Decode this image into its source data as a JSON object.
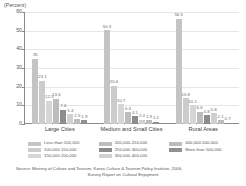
{
  "chart_data": {
    "type": "bar",
    "title": "",
    "ylabel": "(Percent)",
    "xlabel": "",
    "ylim": [
      0,
      60
    ],
    "yticks": [
      0,
      10,
      20,
      30,
      40,
      50,
      60
    ],
    "grid": true,
    "legend_position": "bottom",
    "categories": [
      "Large Cities",
      "Medium and Small Cities",
      "Rural Areas"
    ],
    "series": [
      {
        "name": "Less than 100,000",
        "color": "#c4c4c4",
        "values": [
          35.0,
          50.3,
          56.5
        ]
      },
      {
        "name": "100,000-150,000",
        "color": "#cccccc",
        "values": [
          23.1,
          20.6,
          13.8
        ]
      },
      {
        "name": "150,000-200,000",
        "color": "#d6d6d6",
        "values": [
          12.5,
          10.7,
          10.1
        ]
      },
      {
        "name": "200,000-250,000",
        "color": "#bdbdbd",
        "values": [
          13.6,
          6.3,
          6.6
        ]
      },
      {
        "name": "250,000-300,000",
        "color": "#8c8c8c",
        "values": [
          7.6,
          4.1,
          4.8
        ]
      },
      {
        "name": "300,000-400,000",
        "color": "#d0d0d0",
        "values": [
          5.4,
          2.4,
          5.8
        ]
      },
      {
        "name": "400,000-500,000",
        "color": "#bcbcbc",
        "values": [
          2.5,
          1.9,
          2.1
        ]
      },
      {
        "name": "More than 500,000",
        "color": "#909090",
        "values": [
          1.9,
          1.2,
          0.7
        ]
      }
    ],
    "bar_labels": {
      "Large Cities": [
        "35",
        "23.1",
        "12.5",
        "13.6",
        "7.6",
        "5.4",
        "2.5",
        "1.9"
      ],
      "Medium and Small Cities": [
        "50.3",
        "20.6",
        "10.7",
        "6.3",
        "4.1",
        "2.4",
        "1.9",
        "1.2"
      ],
      "Rural Areas": [
        "56.5",
        "13.8",
        "10.1",
        "6.6",
        "4.8",
        "5.8",
        "2.1",
        "0.7"
      ]
    }
  },
  "axis": {
    "y_unit_label": "(Percent)",
    "tick_60": "60",
    "tick_50": "50",
    "tick_40": "40",
    "tick_30": "30",
    "tick_20": "20",
    "tick_10": "10",
    "tick_0": "0"
  },
  "categories": {
    "c0": "Large Cities",
    "c1": "Medium and Small Cities",
    "c2": "Rural Areas"
  },
  "legend": {
    "col1": [
      {
        "label": "Less than 100,000",
        "color": "#c4c4c4"
      },
      {
        "label": "100,000-150,000",
        "color": "#cccccc"
      },
      {
        "label": "150,000-200,000",
        "color": "#d6d6d6"
      }
    ],
    "col2": [
      {
        "label": "200,000-250,000",
        "color": "#bdbdbd"
      },
      {
        "label": "250,000-300,000",
        "color": "#8c8c8c"
      },
      {
        "label": "300,000-400,000",
        "color": "#d0d0d0"
      }
    ],
    "col3": [
      {
        "label": "400,000-500,000",
        "color": "#bcbcbc"
      },
      {
        "label": "More than 500,000",
        "color": "#909090"
      }
    ]
  },
  "source": {
    "line1": "Source: Ministry of Culture and Tourism, Korea Culture & Tourism Policy Institute, 2006,",
    "line2": "Survey Report on Cultural Enjoyment"
  }
}
